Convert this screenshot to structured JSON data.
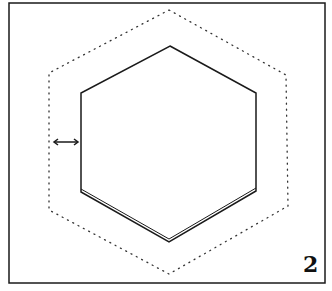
{
  "figure": {
    "number_label": "2",
    "colors": {
      "stroke": "#1a1a1a",
      "background": "#ffffff"
    }
  },
  "diagram": {
    "frame": {
      "x": 9,
      "y": 3,
      "width": 316,
      "height": 280
    },
    "inner_hexagon": {
      "style": "solid",
      "points": [
        [
          170,
          46
        ],
        [
          256,
          93
        ],
        [
          256,
          191
        ],
        [
          169,
          242
        ],
        [
          81,
          192
        ],
        [
          81,
          93
        ]
      ]
    },
    "outer_hexagon": {
      "style": "dotted",
      "points": [
        [
          169,
          10
        ],
        [
          286,
          75
        ],
        [
          288,
          206
        ],
        [
          169,
          274
        ],
        [
          49,
          210
        ],
        [
          49,
          73
        ]
      ]
    },
    "offset_arrow": {
      "style": "double-headed",
      "from": [
        53,
        142
      ],
      "to": [
        79,
        142
      ]
    }
  }
}
